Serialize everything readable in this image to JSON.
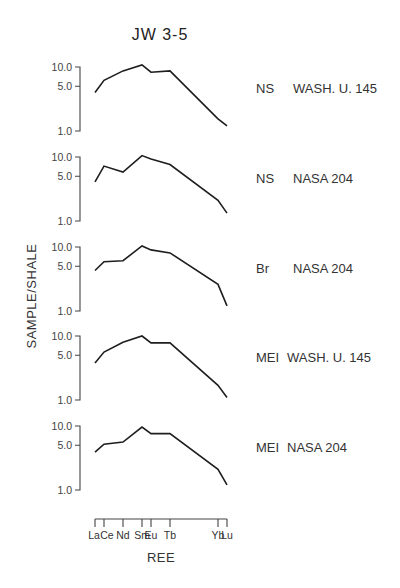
{
  "chart_data": {
    "type": "line",
    "title": "JW 3-5",
    "xlabel": "REE",
    "ylabel": "SAMPLE/SHALE",
    "yscale": "log",
    "ylim": [
      1.0,
      10.0
    ],
    "y_ticks": [
      "10.0",
      "5.0",
      "1.0"
    ],
    "grid": false,
    "legend_position": "right-of-each-panel",
    "categories": [
      "La",
      "Ce",
      "Nd",
      "Sm",
      "Eu",
      "Tb",
      "Yb",
      "Lu"
    ],
    "x_positions": [
      1,
      2,
      4,
      6,
      7,
      9,
      14,
      15
    ],
    "series": [
      {
        "name": "NS WASH. U. 145",
        "label_left": "NS",
        "label_right": "WASH. U. 145",
        "values": [
          4.0,
          6.2,
          8.7,
          10.8,
          8.3,
          8.7,
          1.55,
          1.2
        ]
      },
      {
        "name": "NS NASA 204",
        "label_left": "NS",
        "label_right": "NASA 204",
        "values": [
          4.1,
          7.2,
          5.8,
          10.5,
          9.3,
          7.6,
          2.1,
          1.33
        ]
      },
      {
        "name": "Br NASA 204",
        "label_left": "Br",
        "label_right": "NASA 204",
        "values": [
          4.3,
          5.9,
          6.1,
          10.4,
          9.0,
          8.1,
          2.6,
          1.2
        ]
      },
      {
        "name": "MEI WASH. U. 145",
        "label_left": "MEI",
        "label_right": "WASH. U. 145",
        "values": [
          3.8,
          5.6,
          8.0,
          10.0,
          7.8,
          7.8,
          1.7,
          1.1
        ]
      },
      {
        "name": "MEI NASA 204",
        "label_left": "MEI",
        "label_right": "NASA 204",
        "values": [
          3.9,
          5.2,
          5.6,
          9.6,
          7.6,
          7.6,
          2.1,
          1.2
        ]
      }
    ]
  },
  "layout": {
    "panel_one_y": [
      131,
      221,
      311,
      400,
      490
    ],
    "decade_px": 64,
    "axis_x": 80,
    "x_pixel": [
      95,
      104,
      123,
      142,
      151,
      170,
      218,
      227
    ],
    "x_axis_y": 519
  }
}
